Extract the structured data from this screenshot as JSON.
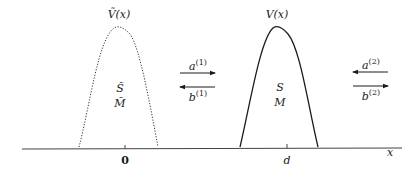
{
  "diagram": {
    "left_barrier": {
      "curve_label": "Ṽ(x)",
      "style": "dotted",
      "line1": "S̃",
      "line2": "M̃",
      "position_label": "0"
    },
    "right_barrier": {
      "curve_label": "V(x)",
      "style": "solid",
      "line1": "S",
      "line2": "M",
      "position_label": "d"
    },
    "axis": {
      "label": "x"
    },
    "middle_arrows": {
      "top": {
        "base": "a",
        "sup": "(1)",
        "direction": "right"
      },
      "bottom": {
        "base": "b",
        "sup": "(1)",
        "direction": "left"
      }
    },
    "right_arrows": {
      "top": {
        "base": "a",
        "sup": "(2)",
        "direction": "left"
      },
      "bottom": {
        "base": "b",
        "sup": "(2)",
        "direction": "right"
      }
    },
    "colors": {
      "ink": "#1a1a1a",
      "background": "#ffffff"
    }
  }
}
